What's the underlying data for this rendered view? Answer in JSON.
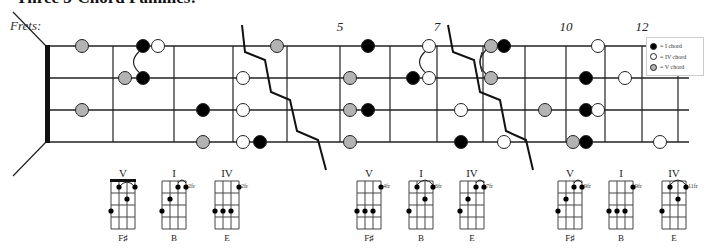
{
  "title": "Three 3-Chord Families:",
  "neck": {
    "label": "Frets:",
    "fret_numbers": [
      {
        "label": "5",
        "x": 340
      },
      {
        "label": "7",
        "x": 437
      },
      {
        "label": "10",
        "x": 566
      },
      {
        "label": "12",
        "x": 642
      }
    ]
  },
  "colors": {
    "I_chord": "#000000",
    "IV_chord": "#ffffff",
    "V_chord": "#b3b3b3",
    "line": "#222222"
  },
  "legend": {
    "items": [
      {
        "label": "= I chord",
        "color": "#000000"
      },
      {
        "label": "= IV chord",
        "color": "#ffffff"
      },
      {
        "label": "= V chord",
        "color": "#b3b3b3"
      }
    ]
  },
  "chord_groups": [
    {
      "chords": [
        {
          "roman": "V",
          "name": "F♯",
          "position": ""
        },
        {
          "roman": "I",
          "name": "B",
          "position": "2fr"
        },
        {
          "roman": "IV",
          "name": "E",
          "position": "2fr"
        }
      ]
    },
    {
      "chords": [
        {
          "roman": "V",
          "name": "F♯",
          "position": "4fr"
        },
        {
          "roman": "I",
          "name": "B",
          "position": "6fr"
        },
        {
          "roman": "IV",
          "name": "E",
          "position": "7fr"
        }
      ]
    },
    {
      "chords": [
        {
          "roman": "V",
          "name": "F♯",
          "position": "9fr"
        },
        {
          "roman": "I",
          "name": "B",
          "position": "9fr"
        },
        {
          "roman": "IV",
          "name": "E",
          "position": "11fr"
        }
      ]
    }
  ]
}
